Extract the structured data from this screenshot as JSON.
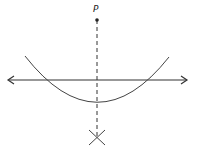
{
  "diagram": {
    "type": "geometric-construction",
    "point_label": "P",
    "colors": {
      "stroke": "#333333",
      "background": "#ffffff"
    },
    "elements": {
      "point_P": {
        "x": 97,
        "y": 20
      },
      "line": {
        "y": 80,
        "x1": 8,
        "x2": 188,
        "arrows": "both"
      },
      "arc": {
        "center_of": "P",
        "start": [
          25,
          56
        ],
        "end": [
          169,
          57
        ],
        "lowest": [
          97,
          101
        ]
      },
      "perpendicular": {
        "x": 97,
        "y1": 20,
        "y2": 138,
        "style": "dashed"
      },
      "intersection_mark": {
        "x": 97,
        "y": 137,
        "style": "X"
      }
    }
  }
}
